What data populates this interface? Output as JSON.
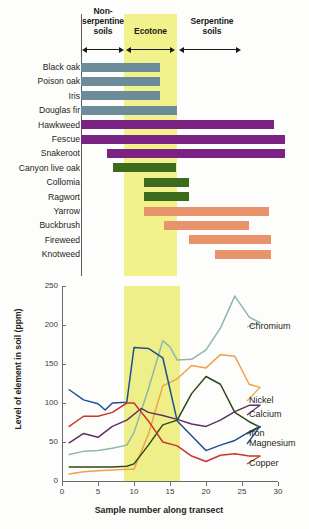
{
  "figure": {
    "top_panel": {
      "zones": [
        {
          "name": "non-serpentine",
          "label": "Non-\nserpentine\nsoils"
        },
        {
          "name": "ecotone",
          "label": "Ecotone"
        },
        {
          "name": "serpentine",
          "label": "Serpentine\nsoils"
        }
      ],
      "ecotone_band_color": "#eeee6e",
      "species": [
        {
          "label": "Black oak",
          "start": 0.0,
          "end": 10.8,
          "color": "#6d8c99",
          "group": "non-serpentine"
        },
        {
          "label": "Poison oak",
          "start": 0.0,
          "end": 10.8,
          "color": "#6d8c99",
          "group": "non-serpentine"
        },
        {
          "label": "Iris",
          "start": 0.0,
          "end": 10.8,
          "color": "#6d8c99",
          "group": "non-serpentine"
        },
        {
          "label": "Douglas fir",
          "start": 0.0,
          "end": 13.2,
          "color": "#6d8c99",
          "group": "non-serpentine"
        },
        {
          "label": "Hawkweed",
          "start": 0.0,
          "end": 26.5,
          "color": "#7b2382",
          "group": "generalist"
        },
        {
          "label": "Fescue",
          "start": 0.0,
          "end": 28.0,
          "color": "#7b2382",
          "group": "generalist"
        },
        {
          "label": "Snakeroot",
          "start": 3.6,
          "end": 28.0,
          "color": "#7b2382",
          "group": "generalist"
        },
        {
          "label": "Canyon live oak",
          "start": 4.4,
          "end": 13.0,
          "color": "#3d6b1e",
          "group": "ecotone"
        },
        {
          "label": "Collomia",
          "start": 8.6,
          "end": 14.8,
          "color": "#3d6b1e",
          "group": "ecotone"
        },
        {
          "label": "Ragwort",
          "start": 8.6,
          "end": 14.8,
          "color": "#3d6b1e",
          "group": "ecotone"
        },
        {
          "label": "Yarrow",
          "start": 8.6,
          "end": 25.8,
          "color": "#e8936b",
          "group": "serpentine"
        },
        {
          "label": "Buckbrush",
          "start": 11.4,
          "end": 23.0,
          "color": "#e8936b",
          "group": "serpentine"
        },
        {
          "label": "Fireweed",
          "start": 14.8,
          "end": 26.0,
          "color": "#e8936b",
          "group": "serpentine"
        },
        {
          "label": "Knotweed",
          "start": 18.4,
          "end": 26.0,
          "color": "#e8936b",
          "group": "serpentine"
        }
      ],
      "axis_min": 0,
      "axis_max": 30
    }
  },
  "chart_data": {
    "type": "line",
    "title": "",
    "xlabel": "Sample number along transect",
    "ylabel": "Level of element in soil (ppm)",
    "xlim": [
      0,
      30
    ],
    "ylim": [
      0,
      250
    ],
    "yticks": [
      0,
      50,
      100,
      150,
      200,
      250
    ],
    "xticks": [
      0,
      5,
      10,
      15,
      20,
      25,
      30
    ],
    "grid": false,
    "legend_position": "right-inline",
    "ecotone_span": [
      8.6,
      16.4
    ],
    "ecotone_color": "#e9e95e",
    "series": [
      {
        "name": "Chromium",
        "color": "#8fb6ab",
        "x": [
          1,
          3,
          5,
          7,
          9,
          10,
          12,
          14,
          15,
          16,
          18,
          20,
          22,
          24,
          26,
          27.5
        ],
        "y": [
          34,
          38,
          39,
          42,
          46,
          62,
          118,
          180,
          172,
          155,
          156,
          168,
          196,
          237,
          210,
          203
        ]
      },
      {
        "name": "Nickel",
        "color": "#f0a14b",
        "x": [
          1,
          3,
          5,
          7,
          9,
          10,
          12,
          14,
          16,
          18,
          20,
          22,
          24,
          26,
          27.5
        ],
        "y": [
          9,
          12,
          13,
          14,
          15,
          15,
          60,
          122,
          131,
          148,
          145,
          162,
          160,
          124,
          120
        ]
      },
      {
        "name": "Calcium",
        "color": "#5e3066",
        "x": [
          1,
          3,
          5,
          7,
          9,
          11,
          12,
          14,
          16,
          18,
          20,
          22,
          24,
          26,
          27.5
        ],
        "y": [
          49,
          61,
          56,
          70,
          78,
          93,
          88,
          84,
          79,
          73,
          70,
          78,
          89,
          97,
          97
        ]
      },
      {
        "name": "Iron",
        "color": "#2b4a18",
        "x": [
          1,
          3,
          5,
          7,
          9,
          10,
          12,
          14,
          16,
          18,
          20,
          22,
          24,
          26,
          27.5
        ],
        "y": [
          18,
          18,
          18,
          18,
          19,
          22,
          46,
          72,
          78,
          112,
          134,
          124,
          88,
          76,
          69
        ]
      },
      {
        "name": "Magnesium",
        "color": "#1f4f93",
        "x": [
          1,
          3,
          5,
          6,
          7,
          9,
          10,
          12,
          14,
          16,
          18,
          20,
          22,
          24,
          26,
          27.5
        ],
        "y": [
          117,
          104,
          99,
          91,
          100,
          101,
          171,
          170,
          158,
          77,
          58,
          39,
          46,
          52,
          63,
          70
        ]
      },
      {
        "name": "Copper",
        "color": "#c7372f",
        "x": [
          1,
          3,
          5,
          7,
          9,
          10,
          12,
          14,
          16,
          18,
          20,
          22,
          24,
          26,
          27.5
        ],
        "y": [
          70,
          83,
          83,
          88,
          100,
          100,
          77,
          50,
          45,
          32,
          25,
          33,
          35,
          32,
          32
        ]
      }
    ]
  }
}
